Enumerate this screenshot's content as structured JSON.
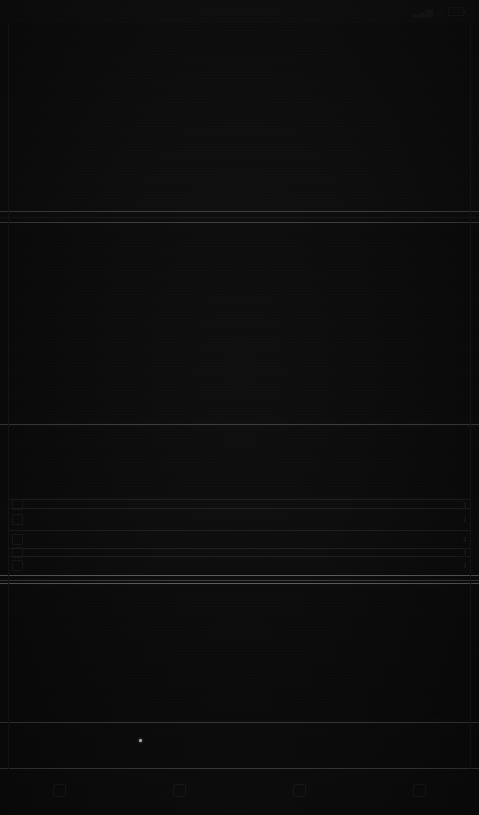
{
  "meta": {
    "appearance": "dark",
    "note_text": "Screenshot is extremely underexposed; content is near-black and largely illegible."
  },
  "colors": {
    "background": "#0a0a0a",
    "surface": "#0b0b0b",
    "separator": "#1c1c1c",
    "separator_bright": "#3a3a3a",
    "separator_brightest": "#5a5a5a",
    "text": "#1d1d1d",
    "cursor": "#cfcfcf"
  },
  "status_bar": {
    "time": "",
    "signal_icon": "signal-icon",
    "wifi_icon": "wifi-icon",
    "battery_icon": "battery-icon",
    "battery_level": ""
  },
  "header": {
    "title": "",
    "subtitle": "",
    "text_rows": [
      "",
      "",
      "",
      "",
      "",
      "",
      "",
      "",
      "",
      ""
    ]
  },
  "sections": [
    {
      "label": "",
      "body_rows": [
        "",
        "",
        "",
        "",
        "",
        "",
        ""
      ]
    },
    {
      "label": "",
      "body_rows": [
        "",
        "",
        "",
        "",
        ""
      ]
    },
    {
      "label": "",
      "body_rows": [
        "",
        "",
        "",
        "",
        "",
        ""
      ]
    }
  ],
  "list": {
    "rows": [
      {
        "icon": "list-item-icon",
        "label": "",
        "value": ""
      },
      {
        "icon": "list-item-icon",
        "label": "",
        "value": ""
      },
      {
        "icon": "list-item-icon",
        "label": "",
        "value": ""
      },
      {
        "icon": "list-item-icon",
        "label": "",
        "value": ""
      },
      {
        "icon": "list-item-icon",
        "label": "",
        "value": ""
      }
    ]
  },
  "bottom_bar": {
    "tabs": [
      {
        "icon": "tab-glyph-1",
        "label": ""
      },
      {
        "icon": "tab-glyph-2",
        "label": ""
      },
      {
        "icon": "tab-glyph-3",
        "label": ""
      },
      {
        "icon": "tab-glyph-4",
        "label": ""
      }
    ]
  },
  "cursor": {
    "x": 140,
    "y": 740
  }
}
